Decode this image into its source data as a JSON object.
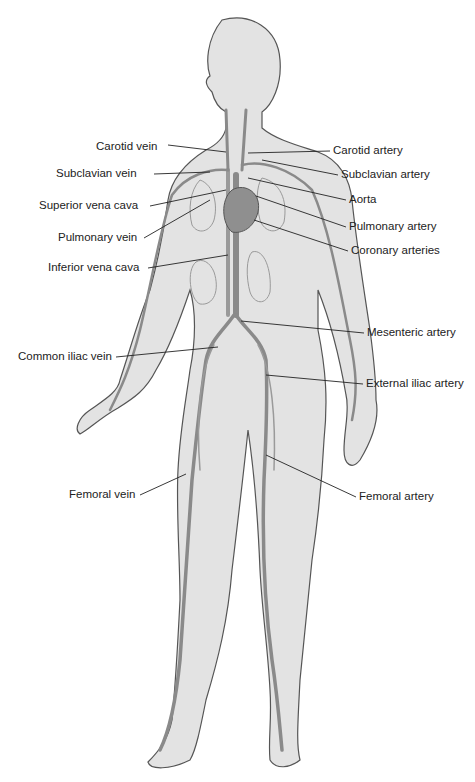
{
  "diagram": {
    "labels_left": [
      {
        "id": "carotid-vein",
        "text": "Carotid vein",
        "x": 96,
        "y": 141,
        "tx": 226,
        "ty": 152
      },
      {
        "id": "subclavian-vein",
        "text": "Subclavian vein",
        "x": 56,
        "y": 171,
        "tx": 210,
        "ty": 172
      },
      {
        "id": "superior-vena-cava",
        "text": "Superior vena cava",
        "x": 39,
        "y": 203,
        "tx": 226,
        "ty": 190
      },
      {
        "id": "pulmonary-vein",
        "text": "Pulmonary vein",
        "x": 58,
        "y": 235,
        "tx": 210,
        "ty": 200
      },
      {
        "id": "inferior-vena-cava",
        "text": "Inferior vena cava",
        "x": 48,
        "y": 265,
        "tx": 228,
        "ty": 255
      },
      {
        "id": "common-iliac-vein",
        "text": "Common iliac vein",
        "x": 18,
        "y": 354,
        "tx": 218,
        "ty": 347
      },
      {
        "id": "femoral-vein",
        "text": "Femoral vein",
        "x": 69,
        "y": 492,
        "tx": 186,
        "ty": 474
      }
    ],
    "labels_right": [
      {
        "id": "carotid-artery",
        "text": "Carotid artery",
        "x": 333,
        "y": 148,
        "tx": 248,
        "ty": 153
      },
      {
        "id": "subclavian-artery",
        "text": "Subclavian artery",
        "x": 341,
        "y": 172,
        "tx": 262,
        "ty": 160
      },
      {
        "id": "aorta",
        "text": "Aorta",
        "x": 349,
        "y": 197,
        "tx": 248,
        "ty": 178
      },
      {
        "id": "pulmonary-artery",
        "text": "Pulmonary artery",
        "x": 349,
        "y": 224,
        "tx": 256,
        "ty": 196
      },
      {
        "id": "coronary-arteries",
        "text": "Coronary arteries",
        "x": 351,
        "y": 248,
        "tx": 254,
        "ty": 220
      },
      {
        "id": "mesenteric-artery",
        "text": "Mesenteric artery",
        "x": 367,
        "y": 330,
        "tx": 241,
        "ty": 321
      },
      {
        "id": "external-iliac-artery",
        "text": "External iliac artery",
        "x": 366,
        "y": 381,
        "tx": 266,
        "ty": 375
      },
      {
        "id": "femoral-artery",
        "text": "Femoral artery",
        "x": 359,
        "y": 494,
        "tx": 266,
        "ty": 455
      }
    ]
  },
  "colors": {
    "background": "#ffffff",
    "body_fill": "#e3e3e3",
    "body_outline": "#555555",
    "vessel": "#8a8a8a",
    "vessel_dark": "#6e6e6e",
    "heart": "#8f8f8f",
    "leader_line": "#222222",
    "label_text": "#222222"
  }
}
